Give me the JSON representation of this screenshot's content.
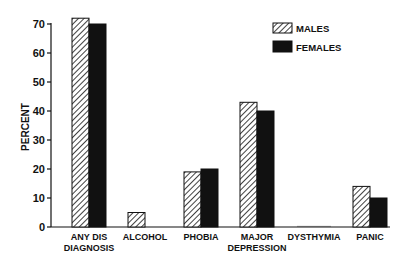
{
  "chart_data": {
    "type": "bar",
    "title": "",
    "xlabel": "",
    "ylabel": "PERCENT",
    "ylim": [
      0,
      70
    ],
    "yticks": [
      0,
      10,
      20,
      30,
      40,
      50,
      60,
      70
    ],
    "grid": false,
    "legend_position": "top-right",
    "categories": [
      [
        "ANY DIS",
        "DIAGNOSIS"
      ],
      [
        "ALCOHOL"
      ],
      [
        "PHOBIA"
      ],
      [
        "MAJOR",
        "DEPRESSION"
      ],
      [
        "DYSTHYMIA"
      ],
      [
        "PANIC"
      ]
    ],
    "category_names": [
      "ANY DIS DIAGNOSIS",
      "ALCOHOL",
      "PHOBIA",
      "MAJOR DEPRESSION",
      "DYSTHYMIA",
      "PANIC"
    ],
    "series": [
      {
        "name": "MALES",
        "pattern": "hatched",
        "color": "#ffffff",
        "values": [
          72,
          5,
          19,
          43,
          0,
          14
        ]
      },
      {
        "name": "FEMALES",
        "pattern": "solid",
        "color": "#111111",
        "values": [
          70,
          0,
          20,
          40,
          0,
          10
        ]
      }
    ]
  },
  "legend": {
    "males_label": "MALES",
    "females_label": "FEMALES"
  },
  "axis": {
    "ylabel": "PERCENT"
  }
}
